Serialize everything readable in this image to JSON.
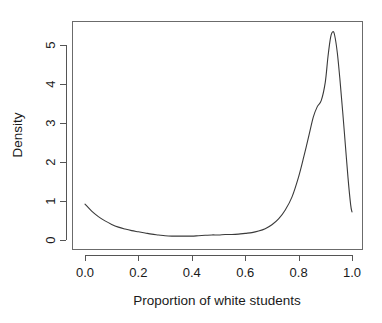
{
  "chart_data": {
    "type": "line",
    "title": "",
    "subtitle": "",
    "xlabel": "Proportion of white students",
    "ylabel": "Density",
    "xlim": [
      0.0,
      1.0
    ],
    "ylim": [
      0.0,
      5.45
    ],
    "grid": false,
    "legend": null,
    "frame": "box",
    "series": [
      {
        "name": "Density",
        "x": [
          0.0,
          0.025,
          0.05,
          0.075,
          0.1,
          0.125,
          0.15,
          0.175,
          0.2,
          0.225,
          0.25,
          0.275,
          0.3,
          0.325,
          0.35,
          0.375,
          0.4,
          0.425,
          0.45,
          0.475,
          0.5,
          0.525,
          0.55,
          0.575,
          0.6,
          0.625,
          0.65,
          0.675,
          0.7,
          0.725,
          0.75,
          0.775,
          0.8,
          0.82,
          0.84,
          0.855,
          0.87,
          0.885,
          0.9,
          0.91,
          0.92,
          0.928,
          0.935,
          0.945,
          0.955,
          0.965,
          0.975,
          0.985,
          0.995,
          1.0
        ],
        "y": [
          0.92,
          0.74,
          0.6,
          0.49,
          0.4,
          0.33,
          0.28,
          0.24,
          0.21,
          0.18,
          0.15,
          0.13,
          0.11,
          0.1,
          0.1,
          0.1,
          0.1,
          0.11,
          0.12,
          0.13,
          0.13,
          0.14,
          0.14,
          0.15,
          0.17,
          0.19,
          0.23,
          0.29,
          0.39,
          0.54,
          0.77,
          1.1,
          1.62,
          2.15,
          2.72,
          3.15,
          3.42,
          3.58,
          4.05,
          4.7,
          5.2,
          5.34,
          5.25,
          4.8,
          4.1,
          3.3,
          2.45,
          1.6,
          0.9,
          0.72
        ]
      }
    ],
    "xticks": [
      {
        "value": 0.0,
        "label": "0.0"
      },
      {
        "value": 0.2,
        "label": "0.2"
      },
      {
        "value": 0.4,
        "label": "0.4"
      },
      {
        "value": 0.6,
        "label": "0.6"
      },
      {
        "value": 0.8,
        "label": "0.8"
      },
      {
        "value": 1.0,
        "label": "1.0"
      }
    ],
    "yticks": [
      {
        "value": 0,
        "label": "0"
      },
      {
        "value": 1,
        "label": "1"
      },
      {
        "value": 2,
        "label": "2"
      },
      {
        "value": 3,
        "label": "3"
      },
      {
        "value": 4,
        "label": "4"
      },
      {
        "value": 5,
        "label": "5"
      }
    ],
    "peak": {
      "x": 0.928,
      "y": 5.34
    },
    "colors": {
      "curve": "#3a3a3a",
      "axis": "#555555",
      "frame": "#6b6b6b",
      "text": "#1a1a1a",
      "background": "#ffffff"
    }
  }
}
